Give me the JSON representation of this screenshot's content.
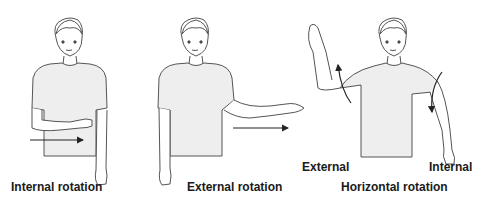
{
  "figure": {
    "panels": [
      {
        "id": "internal",
        "caption": "Internal rotation"
      },
      {
        "id": "external",
        "caption": "External rotation"
      },
      {
        "id": "horizontal",
        "caption": "Horizontal rotation",
        "sub_labels": {
          "left": "External",
          "right": "Internal"
        }
      }
    ],
    "colors": {
      "shirt": "#eeeeee",
      "skin": "#ffffff",
      "stroke": "#555555",
      "arrow": "#222222",
      "text": "#1a1a1a"
    }
  }
}
